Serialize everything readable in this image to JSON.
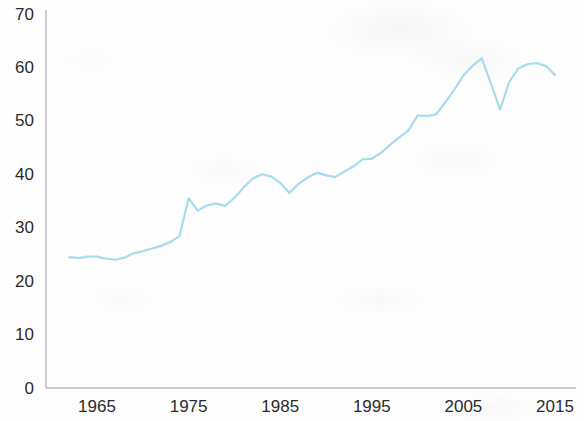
{
  "chart_data": {
    "type": "line",
    "title": "",
    "subtitle": "",
    "xlabel": "",
    "ylabel": "",
    "xlim": [
      1962,
      2016
    ],
    "ylim": [
      0,
      70
    ],
    "grid": false,
    "legend": null,
    "axis_color": "#b9b9bd",
    "line_color": "#a6dcee",
    "line_width": 2.2,
    "x_ticks": [
      1965,
      1975,
      1985,
      1995,
      2005,
      2015
    ],
    "x_tick_labels": [
      "1965",
      "1975",
      "1985",
      "1995",
      "2005",
      "2015"
    ],
    "y_ticks": [
      0,
      10,
      20,
      30,
      40,
      50,
      60,
      70
    ],
    "y_tick_labels": [
      "0",
      "10",
      "20",
      "30",
      "40",
      "50",
      "60",
      "70"
    ],
    "series": [
      {
        "name": "value",
        "color": "#a6dcee",
        "x": [
          1962,
          1963,
          1964,
          1965,
          1966,
          1967,
          1968,
          1969,
          1970,
          1971,
          1972,
          1973,
          1974,
          1975,
          1976,
          1977,
          1978,
          1979,
          1980,
          1981,
          1982,
          1983,
          1984,
          1985,
          1986,
          1987,
          1988,
          1989,
          1990,
          1991,
          1992,
          1993,
          1994,
          1995,
          1996,
          1997,
          1998,
          1999,
          2000,
          2001,
          2002,
          2003,
          2004,
          2005,
          2006,
          2007,
          2008,
          2009,
          2010,
          2011,
          2012,
          2013,
          2014,
          2015
        ],
        "values": [
          24.5,
          24.3,
          24.6,
          24.6,
          24.2,
          24.0,
          24.4,
          25.2,
          25.6,
          26.1,
          26.6,
          27.3,
          28.4,
          35.5,
          33.2,
          34.2,
          34.5,
          34.1,
          35.6,
          37.5,
          39.2,
          40.0,
          39.6,
          38.4,
          36.5,
          38.2,
          39.4,
          40.3,
          39.8,
          39.5,
          40.5,
          41.5,
          42.8,
          42.9,
          44.0,
          45.5,
          46.9,
          48.2,
          51.0,
          50.9,
          51.2,
          53.4,
          55.8,
          58.5,
          60.3,
          61.7,
          57.0,
          52.1,
          57.3,
          59.8,
          60.6,
          60.8,
          60.3,
          58.6
        ]
      }
    ]
  },
  "axes": {
    "plot_left_px": 46,
    "plot_bottom_px": 388,
    "plot_right_px": 576,
    "plot_top_px": 10
  }
}
